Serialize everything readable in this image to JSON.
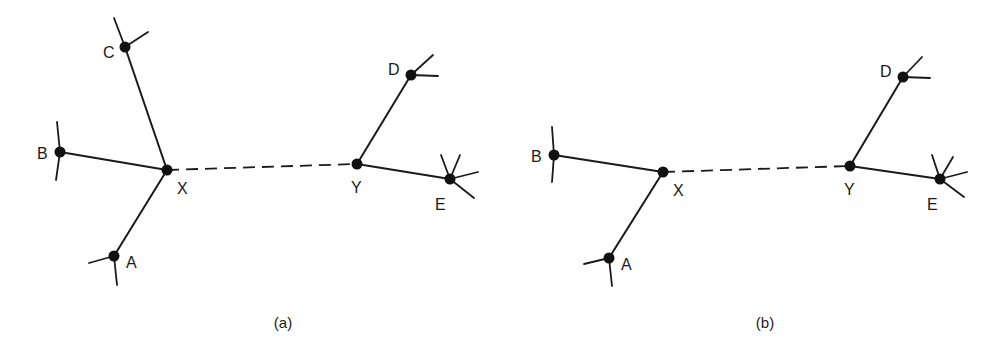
{
  "colors": {
    "ink": "#1a1a1a",
    "background": "#ffffff"
  },
  "panels": [
    {
      "id": "a",
      "caption": "(a)",
      "caption_pos": [
        283,
        328
      ],
      "nodes": [
        {
          "id": "C",
          "label": "C",
          "x": 125,
          "y": 47,
          "label_x": 103,
          "label_y": 58,
          "stubs": [
            [
              114,
              18
            ],
            [
              148,
              32
            ]
          ]
        },
        {
          "id": "B",
          "label": "B",
          "x": 60,
          "y": 152,
          "label_x": 37,
          "label_y": 159,
          "stubs": [
            [
              57,
              122
            ],
            [
              56,
              180
            ]
          ]
        },
        {
          "id": "X",
          "label": "X",
          "x": 167,
          "y": 170,
          "label_x": 177,
          "label_y": 194,
          "stubs": []
        },
        {
          "id": "A",
          "label": "A",
          "x": 114,
          "y": 256,
          "label_x": 126,
          "label_y": 268,
          "stubs": [
            [
              89,
              263
            ],
            [
              117,
              285
            ]
          ]
        },
        {
          "id": "Y",
          "label": "Y",
          "x": 357,
          "y": 164,
          "label_x": 351,
          "label_y": 193,
          "stubs": []
        },
        {
          "id": "D",
          "label": "D",
          "x": 411,
          "y": 75,
          "label_x": 388,
          "label_y": 75,
          "stubs": [
            [
              433,
              55
            ],
            [
              438,
              76
            ]
          ]
        },
        {
          "id": "E",
          "label": "E",
          "x": 450,
          "y": 179,
          "label_x": 435,
          "label_y": 210,
          "stubs": [
            [
              441,
              155
            ],
            [
              460,
              155
            ],
            [
              478,
              172
            ],
            [
              474,
              198
            ]
          ]
        }
      ],
      "edges": [
        {
          "from": "C",
          "to": "X",
          "style": "solid"
        },
        {
          "from": "B",
          "to": "X",
          "style": "solid"
        },
        {
          "from": "A",
          "to": "X",
          "style": "solid"
        },
        {
          "from": "X",
          "to": "Y",
          "style": "dashed"
        },
        {
          "from": "Y",
          "to": "D",
          "style": "solid"
        },
        {
          "from": "Y",
          "to": "E",
          "style": "solid"
        }
      ]
    },
    {
      "id": "b",
      "caption": "(b)",
      "caption_pos": [
        765,
        328
      ],
      "nodes": [
        {
          "id": "B",
          "label": "B",
          "x": 554,
          "y": 155,
          "label_x": 531,
          "label_y": 162,
          "stubs": [
            [
              552,
              127
            ],
            [
              552,
              182
            ]
          ]
        },
        {
          "id": "X",
          "label": "X",
          "x": 663,
          "y": 172,
          "label_x": 673,
          "label_y": 196,
          "stubs": []
        },
        {
          "id": "A",
          "label": "A",
          "x": 609,
          "y": 258,
          "label_x": 621,
          "label_y": 270,
          "stubs": [
            [
              584,
              264
            ],
            [
              612,
              286
            ]
          ]
        },
        {
          "id": "Y",
          "label": "Y",
          "x": 850,
          "y": 166,
          "label_x": 844,
          "label_y": 195,
          "stubs": []
        },
        {
          "id": "D",
          "label": "D",
          "x": 903,
          "y": 77,
          "label_x": 880,
          "label_y": 77,
          "stubs": [
            [
              922,
              57
            ],
            [
              930,
              78
            ]
          ]
        },
        {
          "id": "E",
          "label": "E",
          "x": 940,
          "y": 179,
          "label_x": 927,
          "label_y": 210,
          "stubs": [
            [
              932,
              155
            ],
            [
              953,
              157
            ],
            [
              967,
              172
            ],
            [
              964,
              197
            ]
          ]
        }
      ],
      "edges": [
        {
          "from": "B",
          "to": "X",
          "style": "solid"
        },
        {
          "from": "A",
          "to": "X",
          "style": "solid"
        },
        {
          "from": "X",
          "to": "Y",
          "style": "dashed"
        },
        {
          "from": "Y",
          "to": "D",
          "style": "solid"
        },
        {
          "from": "Y",
          "to": "E",
          "style": "solid"
        }
      ]
    }
  ]
}
